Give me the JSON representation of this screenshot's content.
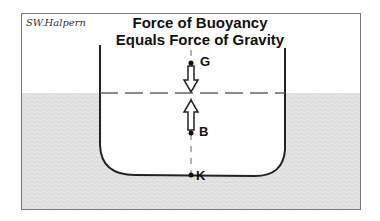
{
  "signature": "SW.Halpern",
  "title_line1": "Force of Buoyancy",
  "title_line2": "Equals Force of Gravity",
  "points": {
    "G": "G",
    "B": "B",
    "K": "K"
  },
  "colors": {
    "water": "#e6e6e6",
    "hull": "#222222",
    "frame": "#777777"
  }
}
